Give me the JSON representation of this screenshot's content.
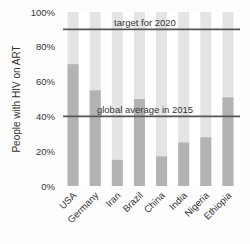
{
  "chart_data": {
    "type": "bar",
    "title": "",
    "xlabel": "",
    "ylabel": "People with HIV on ART",
    "ylim": [
      0,
      100
    ],
    "yticks": [
      "0%",
      "20%",
      "40%",
      "60%",
      "80%",
      "100%"
    ],
    "categories": [
      "USA",
      "Germany",
      "Iran",
      "Brazil",
      "China",
      "India",
      "Nigeria",
      "Ethiopia"
    ],
    "values": [
      70,
      55,
      15,
      50,
      17,
      25,
      28,
      51
    ],
    "background_value": 100,
    "reference_lines": [
      {
        "label": "target for 2020",
        "value": 90
      },
      {
        "label": "global average in 2015",
        "value": 40
      }
    ],
    "grid": false,
    "legend": "none"
  },
  "colors": {
    "bar_fill": "#b3b3b3",
    "bar_background": "#e4e4e4",
    "reference_line": "#555555",
    "text": "#333333"
  }
}
